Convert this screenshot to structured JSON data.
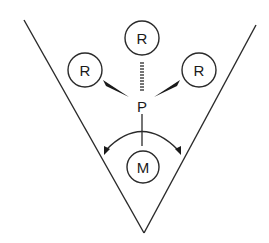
{
  "diagram": {
    "type": "chemical-structure",
    "colors": {
      "line": "#2a2a2a",
      "background": "#ffffff"
    },
    "cone": {
      "left_top": [
        24,
        20
      ],
      "apex": [
        144,
        233
      ],
      "right_top": [
        256,
        25
      ]
    },
    "center_atom": {
      "label": "P",
      "position": [
        142,
        106
      ]
    },
    "substituents": [
      {
        "label": "R",
        "position": [
          142,
          38
        ],
        "bond": "hashed-wedge"
      },
      {
        "label": "R",
        "position": [
          85,
          70
        ],
        "bond": "solid-wedge"
      },
      {
        "label": "R",
        "position": [
          199,
          70
        ],
        "bond": "solid-wedge"
      }
    ],
    "metal": {
      "label": "M",
      "position": [
        143,
        167
      ],
      "bond": "single"
    },
    "angle_arrow": {
      "type": "double-headed-arc",
      "meaning": "cone angle"
    }
  }
}
